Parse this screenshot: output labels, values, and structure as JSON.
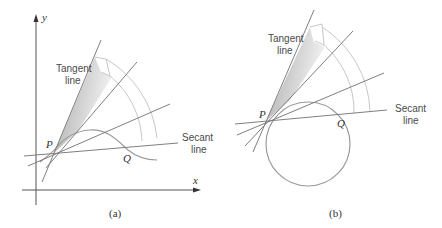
{
  "colors": {
    "line": "#7f7f7f",
    "curve": "#9a9a9a",
    "arc": "#c4c4c4",
    "axis": "#444444",
    "shade_dark": "#b8b8b8",
    "shade_light": "#f0f0f0",
    "text": "#4a4a4a"
  },
  "panel_a": {
    "caption": "(a)",
    "axis_x_label": "x",
    "axis_y_label": "y",
    "point_p_label": "P",
    "point_q_label": "Q",
    "tangent_label_line1": "Tangent",
    "tangent_label_line2": "line",
    "secant_label_line1": "Secant",
    "secant_label_line2": "line"
  },
  "panel_b": {
    "caption": "(b)",
    "point_p_label": "P",
    "point_q_label": "Q",
    "tangent_label_line1": "Tangent",
    "tangent_label_line2": "line",
    "secant_label_line1": "Secant",
    "secant_label_line2": "line"
  }
}
